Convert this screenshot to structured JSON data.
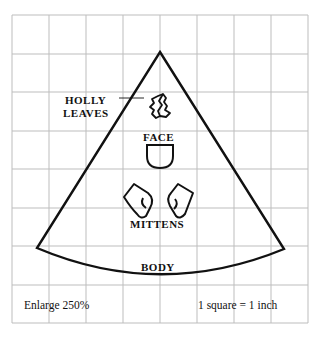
{
  "diagram": {
    "grid": {
      "x0": 12,
      "y0": 15,
      "cols": 8,
      "rows": 8,
      "cell_w": 37,
      "cell_h": 38.5,
      "line_color": "#bdbdbd"
    },
    "outline_color": "#111111",
    "pieces": {
      "holly_leaves": "HOLLY",
      "holly_leaves_line2": "LEAVES",
      "face": "FACE",
      "mittens": "MITTENS",
      "body": "BODY"
    },
    "notes": {
      "enlarge": "Enlarge 250%",
      "scale": "1 square = 1 inch"
    }
  }
}
